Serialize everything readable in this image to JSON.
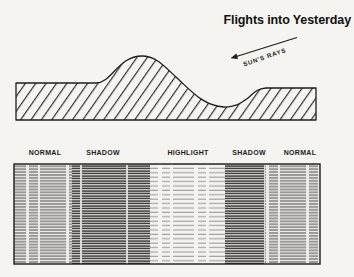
{
  "title": "Flights into Yesterday",
  "annotations": {
    "sun_rays_label": "SUN'S RAYS"
  },
  "zone_labels": [
    {
      "label": "NORMAL"
    },
    {
      "label": "SHADOW"
    },
    {
      "label": "HIGHLIGHT"
    },
    {
      "label": "SHADOW"
    },
    {
      "label": "NORMAL"
    }
  ],
  "figure": {
    "type": "terrain-cross-section-with-tone-strip",
    "zones_order": [
      "NORMAL",
      "SHADOW",
      "HIGHLIGHT",
      "SHADOW",
      "NORMAL"
    ]
  },
  "colors": {
    "paper": "#f5f4f1",
    "ink": "#1c1c1c",
    "shadow_zone_bg": "#ddd9d3",
    "normal_zone_bg": "#eceae5",
    "highlight_zone_bg": "#f3f2ee"
  }
}
